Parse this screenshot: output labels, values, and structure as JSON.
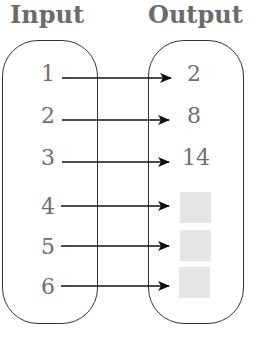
{
  "headers": {
    "input": "Input",
    "output": "Output"
  },
  "inputs": [
    "1",
    "2",
    "3",
    "4",
    "5",
    "6"
  ],
  "outputs": [
    "2",
    "8",
    "14",
    "",
    "",
    ""
  ],
  "missing_outputs": [
    4,
    5,
    6
  ]
}
